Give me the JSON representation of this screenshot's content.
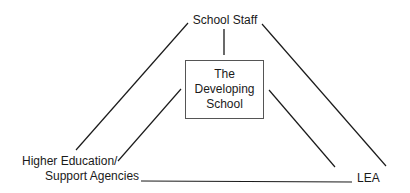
{
  "diagram": {
    "type": "relationship-triangle",
    "center": {
      "lines": [
        "The",
        "Developing",
        "School"
      ]
    },
    "nodes": {
      "top": {
        "label": "School Staff"
      },
      "bottom_left": {
        "lines": [
          "Higher Education/",
          "Support Agencies"
        ]
      },
      "bottom_right": {
        "label": "LEA"
      }
    },
    "edges": [
      {
        "from": "School Staff",
        "to": "The Developing School"
      },
      {
        "from": "School Staff",
        "to": "Higher Education/ Support Agencies"
      },
      {
        "from": "School Staff",
        "to": "LEA"
      },
      {
        "from": "The Developing School",
        "to": "Higher Education/ Support Agencies"
      },
      {
        "from": "The Developing School",
        "to": "LEA"
      },
      {
        "from": "Higher Education/ Support Agencies",
        "to": "LEA"
      }
    ],
    "colors": {
      "line": "#1a1a1a",
      "box_border": "#555555",
      "background": "#ffffff"
    }
  }
}
